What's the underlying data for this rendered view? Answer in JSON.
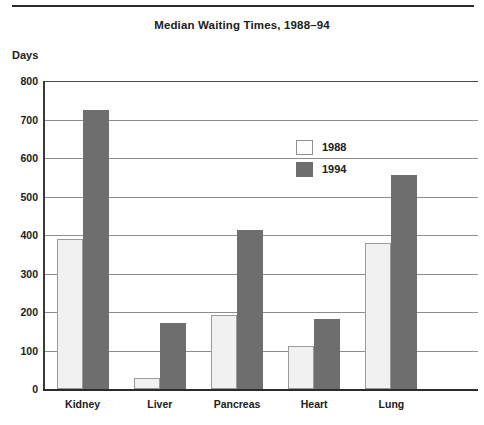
{
  "figure": {
    "title": "Median Waiting Times, 1988–94",
    "y_axis_title": "Days",
    "has_top_rule": true
  },
  "legend": {
    "position": "inside-top-right",
    "entries": [
      {
        "label": "1988",
        "swatch": "light-gray-outlined",
        "color": "#f1f1f1"
      },
      {
        "label": "1994",
        "swatch": "dark-gray-filled",
        "color": "#6e6e6e"
      }
    ]
  },
  "axis": {
    "y_ticks": [
      "800",
      "700",
      "600",
      "500",
      "400",
      "300",
      "200",
      "100",
      "0"
    ],
    "x_ticks": [
      "Kidney",
      "Liver",
      "Pancreas",
      "Heart",
      "Lung"
    ]
  },
  "chart_data": {
    "type": "bar",
    "title": "Median Waiting Times, 1988–94",
    "xlabel": "",
    "ylabel": "Days",
    "categories": [
      "Kidney",
      "Liver",
      "Pancreas",
      "Heart",
      "Lung"
    ],
    "series": [
      {
        "name": "1988",
        "color": "#f1f1f1",
        "values": [
          390,
          28,
          192,
          112,
          378
        ]
      },
      {
        "name": "1994",
        "color": "#6e6e6e",
        "values": [
          725,
          172,
          412,
          182,
          556
        ]
      }
    ],
    "ylim": [
      0,
      800
    ],
    "ytick_step": 100,
    "grid": "horizontal",
    "legend_position": "inside-top-right",
    "units": "days"
  }
}
